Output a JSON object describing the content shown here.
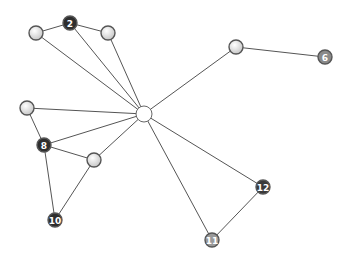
{
  "graph": {
    "hub": {
      "id": "hub",
      "x": 144,
      "y": 114,
      "r": 8,
      "fill": "#ffffff",
      "label": ""
    },
    "nodes": [
      {
        "id": "n1",
        "x": 36,
        "y": 33,
        "r": 7,
        "fill": "#e0e0e0",
        "label": ""
      },
      {
        "id": "n2",
        "x": 70,
        "y": 23,
        "r": 7,
        "fill": "#2e2e2e",
        "label": "2"
      },
      {
        "id": "n3",
        "x": 108,
        "y": 33,
        "r": 7,
        "fill": "#e0e0e0",
        "label": ""
      },
      {
        "id": "n4",
        "x": 236,
        "y": 47,
        "r": 7,
        "fill": "#e8e8e8",
        "label": ""
      },
      {
        "id": "n6",
        "x": 325,
        "y": 57,
        "r": 7,
        "fill": "#8a8a8a",
        "label": "6"
      },
      {
        "id": "n7",
        "x": 27,
        "y": 108,
        "r": 7,
        "fill": "#e0e0e0",
        "label": ""
      },
      {
        "id": "n8",
        "x": 44,
        "y": 145,
        "r": 7,
        "fill": "#2e2e2e",
        "label": "8"
      },
      {
        "id": "n9",
        "x": 94,
        "y": 160,
        "r": 7,
        "fill": "#e8e8e8",
        "label": ""
      },
      {
        "id": "n10",
        "x": 55,
        "y": 220,
        "r": 7,
        "fill": "#2e2e2e",
        "label": "10"
      },
      {
        "id": "n12",
        "x": 263,
        "y": 187,
        "r": 7,
        "fill": "#3a3a3a",
        "label": "12"
      },
      {
        "id": "n11",
        "x": 212,
        "y": 240,
        "r": 7,
        "fill": "#9a9a9a",
        "label": "11"
      }
    ],
    "edges": [
      [
        "n1",
        "n2"
      ],
      [
        "n2",
        "n3"
      ],
      [
        "n1",
        "hub"
      ],
      [
        "n2",
        "hub"
      ],
      [
        "n3",
        "hub"
      ],
      [
        "n4",
        "hub"
      ],
      [
        "n4",
        "n6"
      ],
      [
        "n7",
        "hub"
      ],
      [
        "n7",
        "n8"
      ],
      [
        "n8",
        "hub"
      ],
      [
        "n8",
        "n9"
      ],
      [
        "n8",
        "n10"
      ],
      [
        "n9",
        "hub"
      ],
      [
        "n9",
        "n10"
      ],
      [
        "n11",
        "hub"
      ],
      [
        "n12",
        "hub"
      ],
      [
        "n11",
        "n12"
      ]
    ]
  }
}
